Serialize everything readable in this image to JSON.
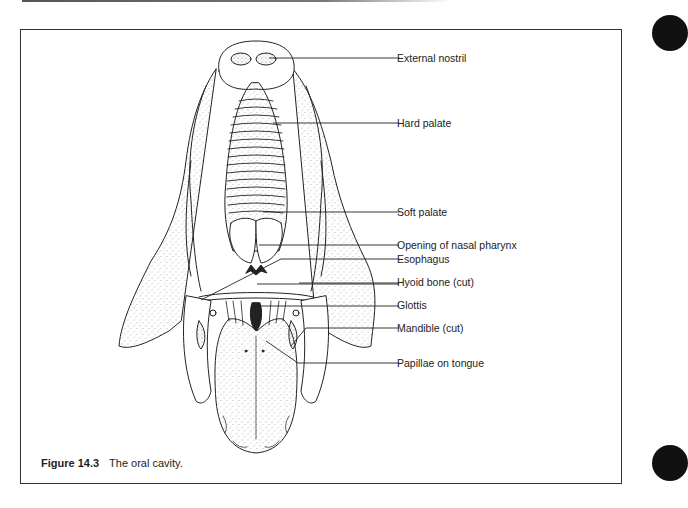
{
  "figure": {
    "number": "Figure 14.3",
    "caption": "The oral cavity.",
    "labels": [
      {
        "id": "external-nostril",
        "text": "External nostril"
      },
      {
        "id": "hard-palate",
        "text": "Hard palate"
      },
      {
        "id": "soft-palate",
        "text": "Soft palate"
      },
      {
        "id": "opening-nasal-pharynx",
        "text": "Opening of nasal pharynx"
      },
      {
        "id": "esophagus",
        "text": "Esophagus"
      },
      {
        "id": "hyoid-bone",
        "text": "Hyoid bone (cut)"
      },
      {
        "id": "glottis",
        "text": "Glottis"
      },
      {
        "id": "mandible",
        "text": "Mandible (cut)"
      },
      {
        "id": "papillae",
        "text": "Papillae on tongue"
      }
    ]
  },
  "colors": {
    "ink": "#222222",
    "border": "#333333",
    "margin_mark": "#111111"
  }
}
